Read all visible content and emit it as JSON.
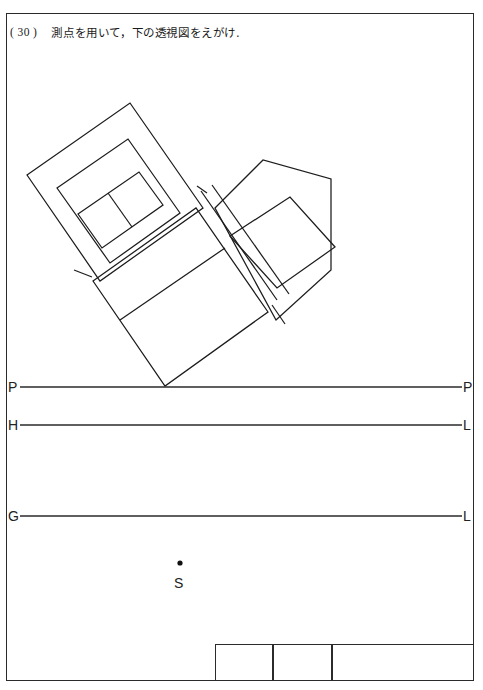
{
  "sheet": {
    "question_number": "( 30 )",
    "question_text": "測点を用いて，下の透視図をえがけ.",
    "border_color": "#2b2b2b",
    "line_color": "#1c1c1c",
    "background": "#ffffff"
  },
  "reference_lines": [
    {
      "id": "picture-plane",
      "left_label": "P",
      "right_label": "P",
      "y": 387
    },
    {
      "id": "horizon-line",
      "left_label": "H",
      "right_label": "L",
      "y": 425
    },
    {
      "id": "ground-line",
      "left_label": "G",
      "right_label": "L",
      "y": 516
    }
  ],
  "station_point": {
    "label": "S",
    "x": 180,
    "y": 566,
    "marker": "dot-marker"
  },
  "title_block": {
    "cells": [
      "",
      "",
      ""
    ],
    "x": 215,
    "y": 644,
    "width": 259,
    "height": 37,
    "dividers": [
      273,
      332
    ]
  },
  "plan_geometry": {
    "description": "rotated building plan view with outer walls, inner rooms and a pentagonal wing",
    "outer_block_upper_left": "27,175 130,103 203,208 100,281",
    "inner_block_upper_left": "57,188 128,139 180,213 110,263",
    "room_pair": "78,214 139,172 163,205 102,248",
    "pentagon_wing": "215,208 263,160 331,179 331,270 276,320",
    "inner_rect_wing": "230,236 290,197 335,247 277,288",
    "central_block": "93,281 196,208 268,312 165,386",
    "central_divider": "120,320 225,248"
  }
}
